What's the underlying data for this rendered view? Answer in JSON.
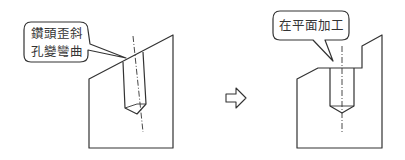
{
  "diagram": {
    "before": {
      "callout_line1": "鑽頭歪斜",
      "callout_line2": "孔變彎曲"
    },
    "arrow": "right-arrow",
    "after": {
      "callout": "在平面加工"
    },
    "colors": {
      "stroke": "#333333",
      "background": "#ffffff"
    }
  }
}
